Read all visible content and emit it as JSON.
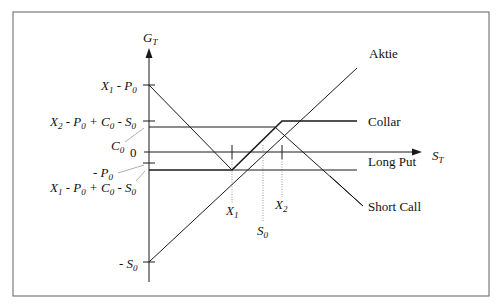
{
  "axes": {
    "y_label": "G",
    "y_label_sub": "T",
    "x_label": "S",
    "x_label_sub": "T",
    "origin_label": "0"
  },
  "y_ticks": [
    {
      "id": "x1_minus_p0",
      "text": "X",
      "sub": "1",
      "rest": " - P",
      "rest_sub": "0",
      "full": "X1 - P0"
    },
    {
      "id": "x2_collar",
      "full": "X2 - P0 + C0 - S0"
    },
    {
      "id": "c0",
      "full": "C0"
    },
    {
      "id": "minus_p0",
      "full": "- P0"
    },
    {
      "id": "x1_collar",
      "full": "X1 - P0 + C0 - S0"
    },
    {
      "id": "minus_s0",
      "full": "- S0"
    }
  ],
  "x_ticks": [
    {
      "id": "x1",
      "full": "X1"
    },
    {
      "id": "s0",
      "full": "S0"
    },
    {
      "id": "x2",
      "full": "X2"
    }
  ],
  "legend": {
    "aktie": "Aktie",
    "collar": "Collar",
    "long_put": "Long Put",
    "short_call": "Short Call"
  },
  "colors": {
    "line": "#1a1a1a",
    "frame": "#7a7a7a",
    "leader": "#b0b0b0",
    "dotted": "#9a9a9a"
  }
}
